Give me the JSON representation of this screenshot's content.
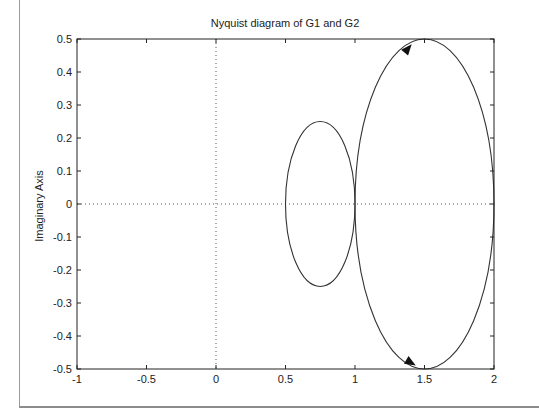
{
  "figure": {
    "title": "Nyquist diagram of G1 and G2"
  },
  "chart_data": {
    "type": "line",
    "title": "Nyquist diagram of G1 and G2",
    "xlabel": "",
    "ylabel": "Imaginary Axis",
    "xlim": [
      -1,
      2
    ],
    "ylim": [
      -0.5,
      0.5
    ],
    "grid": false,
    "zero_lines": {
      "x": 0,
      "y": 0,
      "style": "dotted"
    },
    "x_ticks": [
      -1,
      -0.5,
      0,
      0.5,
      1,
      1.5,
      2
    ],
    "x_tick_labels": [
      "-1",
      "-0.5",
      "0",
      "0.5",
      "1",
      "1.5",
      "2"
    ],
    "y_ticks": [
      0.5,
      0.4,
      0.3,
      0.2,
      0.1,
      0,
      -0.1,
      -0.2,
      -0.3,
      -0.4,
      -0.5
    ],
    "y_tick_labels": [
      "0.5",
      "0.4",
      "0.3",
      "0.2",
      "0.1",
      "0",
      "-0.1",
      "-0.2",
      "-0.3",
      "-0.4",
      "-0.5"
    ],
    "series": [
      {
        "name": "G1",
        "shape": "closed-curve",
        "center": [
          0.75,
          0
        ],
        "radius_real": 0.25,
        "radius_imag": 0.25,
        "real_range": [
          0.5,
          1.0
        ],
        "imag_range": [
          -0.25,
          0.25
        ]
      },
      {
        "name": "G2",
        "shape": "closed-curve",
        "center": [
          1.5,
          0
        ],
        "radius_real": 0.5,
        "radius_imag": 0.5,
        "real_range": [
          1.0,
          2.0
        ],
        "imag_range": [
          -0.5,
          0.5
        ],
        "arrows": [
          {
            "at": [
              1.38,
              0.47
            ],
            "direction": "up-right"
          },
          {
            "at": [
              1.4,
              -0.48
            ],
            "direction": "down-right"
          }
        ]
      }
    ],
    "line_color": "#333333",
    "legend": null
  }
}
